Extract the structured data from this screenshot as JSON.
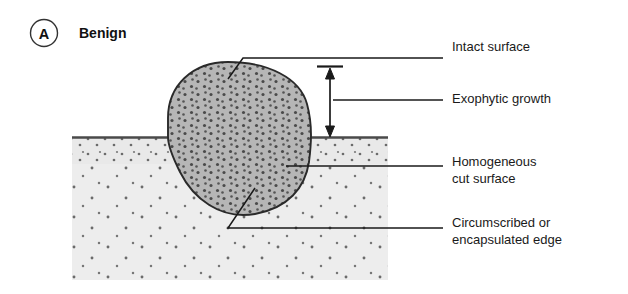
{
  "figure": {
    "panel_letter": "A",
    "panel_title": "Benign",
    "background_color": "#ffffff"
  },
  "colors": {
    "tumor_fill": "#b6b6b6",
    "tumor_stipple": "#4a4a4a",
    "tissue_fill": "#ededed",
    "tissue_stipple": "#6b6b6b",
    "outline": "#2a2a2a",
    "text": "#1a1a1a"
  },
  "annotations": [
    {
      "id": "intact-surface",
      "label": "Intact surface",
      "line2": "",
      "text_x": 452,
      "text_y": 51,
      "leader": "M 228 79 L 243 58 L 443 58"
    },
    {
      "id": "exophytic-growth",
      "label": "Exophytic growth",
      "line2": "",
      "text_x": 452,
      "text_y": 103,
      "leader": "M 333 100 L 443 100"
    },
    {
      "id": "homogeneous-cut-surface",
      "label": "Homogeneous",
      "line2": "cut surface",
      "text_x": 452,
      "text_y": 166,
      "leader": "M 286 166 L 443 166"
    },
    {
      "id": "circumscribed-encapsulated-edge",
      "label": "Circumscribed or",
      "line2": "encapsulated edge",
      "text_x": 452,
      "text_y": 227,
      "leader": "M 255 188 L 228 228 L 443 228"
    }
  ],
  "measure_arrow": {
    "id": "exophytic-height-arrow",
    "x": 330,
    "y_top": 70,
    "y_bottom": 136,
    "cap_half_width": 13,
    "cap_y": 66
  },
  "tissue_block": {
    "x": 72,
    "y": 137,
    "width": 316,
    "height": 143,
    "surface_line_y": 137
  },
  "tumor_mass": {
    "left": 168,
    "right": 311,
    "top": 62,
    "bottom": 216
  }
}
